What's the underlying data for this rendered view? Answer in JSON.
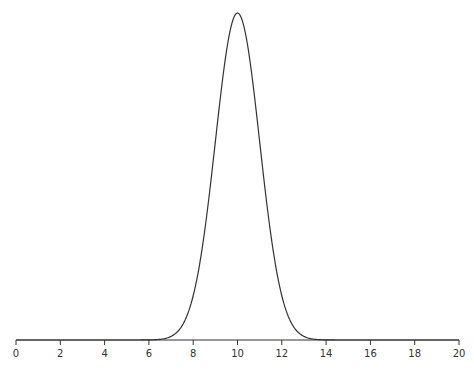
{
  "chart_data": {
    "type": "line",
    "title": "",
    "xlabel": "",
    "ylabel": "",
    "xlim": [
      0,
      20
    ],
    "grid": false,
    "legend": null,
    "x_ticks": [
      0,
      2,
      4,
      6,
      8,
      10,
      12,
      14,
      16,
      18,
      20
    ],
    "x_tick_labels": [
      "0",
      "2",
      "4",
      "6",
      "8",
      "10",
      "12",
      "14",
      "16",
      "18",
      "20"
    ],
    "series": [
      {
        "name": "normal-distribution-curve",
        "distribution": "Gaussian",
        "mean": 10,
        "sigma": 1.0,
        "x": [
          0,
          2,
          4,
          6,
          6.5,
          7,
          7.5,
          8,
          8.5,
          9,
          9.5,
          10,
          10.5,
          11,
          11.5,
          12,
          12.5,
          13,
          13.5,
          14,
          16,
          18,
          20
        ],
        "y_relative": [
          0,
          0,
          0,
          0.0003,
          0.002,
          0.011,
          0.044,
          0.135,
          0.325,
          0.607,
          0.882,
          1.0,
          0.882,
          0.607,
          0.325,
          0.135,
          0.044,
          0.011,
          0.002,
          0.0003,
          0,
          0,
          0
        ]
      }
    ]
  },
  "colors": {
    "line": "#333333",
    "background": "#ffffff"
  }
}
